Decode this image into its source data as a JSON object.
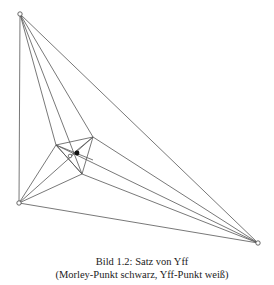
{
  "caption": {
    "line1": "Bild 1.2: Satz von Yff",
    "line2": "(Morley-Punkt schwarz, Yff-Punkt weiß)"
  },
  "diagram": {
    "title": "Satz von Yff",
    "outer_triangle": {
      "A": [
        20,
        14
      ],
      "B": [
        19,
        203
      ],
      "C": [
        258,
        243
      ]
    },
    "inner_triangle": {
      "P1": [
        56,
        145
      ],
      "P2": [
        93,
        137
      ],
      "P3": [
        82,
        174
      ]
    },
    "morley_point": {
      "label": "Morley-Punkt",
      "color": "#000000",
      "pos": [
        77,
        153
      ]
    },
    "yff_point": {
      "label": "Yff-Punkt",
      "color": "#ffffff",
      "pos": [
        70,
        156
      ]
    },
    "line_color": "#555555"
  }
}
